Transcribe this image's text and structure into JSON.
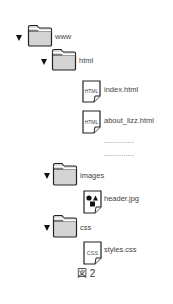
{
  "tree": {
    "root": {
      "label": "www",
      "expanded": true,
      "icon": "folder-icon"
    },
    "html_folder": {
      "label": "html",
      "expanded": true,
      "icon": "folder-icon"
    },
    "files_html": [
      {
        "label": "index.html",
        "icon_text": "HTML"
      },
      {
        "label": "about_lizz.html",
        "icon_text": "HTML"
      }
    ],
    "ellipsis": [
      "..............",
      ".............."
    ],
    "images_folder": {
      "label": "images",
      "expanded": true,
      "icon": "folder-icon"
    },
    "files_images": [
      {
        "label": "header.jpg",
        "icon": "image-file-icon"
      }
    ],
    "css_folder": {
      "label": "css",
      "expanded": true,
      "icon": "folder-icon"
    },
    "files_css": [
      {
        "label": "styles.css",
        "icon_text": "CSS"
      }
    ]
  },
  "caption": "図 2",
  "colors": {
    "folder_fill": "#d4d4d4",
    "outline": "#222222",
    "text": "#444444"
  }
}
